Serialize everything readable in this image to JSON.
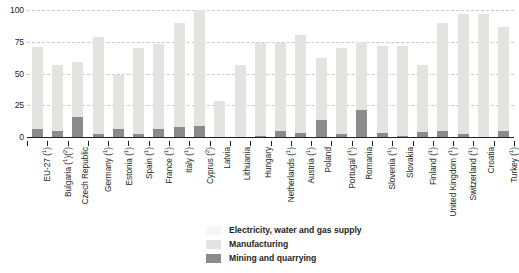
{
  "chart_data": {
    "type": "bar",
    "subtype": "stacked",
    "title": "",
    "xlabel": "",
    "ylabel": "",
    "ylim": [
      0,
      100
    ],
    "yticks": [
      0,
      25,
      50,
      75,
      100
    ],
    "ytick_labels": [
      "0",
      "25",
      "50",
      "75",
      "100"
    ],
    "grid": true,
    "grid_style": "dashed horizontal",
    "legend_position": "bottom-center",
    "categories": [
      "EU-27 (¹)",
      "Bulgaria (¹)(²)",
      "Czech Republic",
      "Germany (¹)",
      "Estonia (¹)",
      "Spain (¹)",
      "France (¹)",
      "Italy (¹)",
      "Cyprus (²)",
      "Latvia",
      "Lithuania",
      "Hungary",
      "Netherlands (¹)",
      "Austria (¹)",
      "Poland",
      "Portugal (¹)",
      "Romania",
      "Slovenia (¹)",
      "Slovakia",
      "Finland (¹)",
      "United Kingdom (¹)",
      "Switzerland (¹)",
      "Croatia",
      "Turkey (¹)"
    ],
    "series": [
      {
        "name": "Mining and quarrying",
        "color": "#8b8b8b",
        "values": [
          6,
          5,
          16,
          2,
          6,
          2,
          6,
          8,
          9,
          0,
          0,
          1,
          5,
          3,
          13,
          2,
          21,
          3,
          1,
          4,
          5,
          2,
          0,
          5
        ]
      },
      {
        "name": "Manufacturing",
        "color": "#e3e3e1",
        "values": [
          65,
          52,
          43,
          77,
          43,
          68,
          67,
          82,
          91,
          28,
          57,
          73,
          69,
          77,
          49,
          68,
          54,
          69,
          71,
          53,
          85,
          95,
          97,
          82
        ]
      },
      {
        "name": "Electricity, water and gas supply",
        "color": "#f6f6f5",
        "values": [
          0,
          0,
          0,
          0,
          0,
          0,
          0,
          0,
          0,
          0,
          0,
          0,
          0,
          0,
          0,
          0,
          0,
          0,
          0,
          0,
          0,
          0,
          0,
          0
        ]
      }
    ],
    "totals": [
      71,
      57,
      59,
      79,
      49,
      70,
      73,
      90,
      100,
      28,
      57,
      74,
      74,
      80,
      62,
      70,
      75,
      72,
      72,
      57,
      90,
      97,
      97,
      87
    ]
  },
  "legend": {
    "items": [
      {
        "label": "Electricity, water and gas supply",
        "color": "#f6f6f5"
      },
      {
        "label": "Manufacturing",
        "color": "#e3e3e1"
      },
      {
        "label": "Mining and quarrying",
        "color": "#8b8b8b"
      }
    ]
  },
  "footnote": {
    "text": ""
  },
  "colors": {
    "axis": "#231f20",
    "grid": "#c9c9c9",
    "background": "#ffffff",
    "text": "#231f20"
  }
}
